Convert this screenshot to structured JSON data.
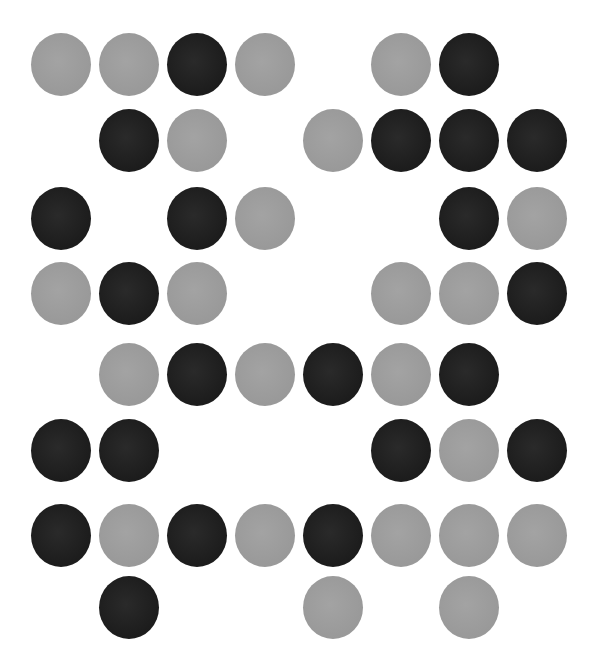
{
  "figure": {
    "colors": {
      "dark": "#1f1f1f",
      "gray": "#9a9a9a",
      "background": "#ffffff"
    },
    "grid": {
      "columns": 8,
      "rows": 8,
      "column_centers_x": [
        61,
        129,
        197,
        265,
        333,
        401,
        469,
        537
      ],
      "row_centers_y": [
        64,
        140,
        218,
        293,
        374,
        450,
        535,
        607
      ],
      "dot_width": 60,
      "dot_height": 63
    },
    "rows": [
      [
        "gray",
        "gray",
        "dark",
        "gray",
        null,
        "gray",
        "dark",
        null
      ],
      [
        null,
        "dark",
        "gray",
        null,
        "gray",
        "dark",
        "dark",
        "dark"
      ],
      [
        "dark",
        null,
        "dark",
        "gray",
        null,
        null,
        "dark",
        "gray"
      ],
      [
        "gray",
        "dark",
        "gray",
        null,
        null,
        "gray",
        "gray",
        "dark"
      ],
      [
        null,
        "gray",
        "dark",
        "gray",
        "dark",
        "gray",
        "dark",
        null
      ],
      [
        "dark",
        "dark",
        null,
        null,
        null,
        "dark",
        "gray",
        "dark"
      ],
      [
        "dark",
        "gray",
        "dark",
        "gray",
        "dark",
        "gray",
        "gray",
        "gray"
      ],
      [
        null,
        "dark",
        null,
        null,
        "gray",
        null,
        "gray",
        null
      ]
    ],
    "counts": {
      "dark": 23,
      "gray": 24
    }
  }
}
